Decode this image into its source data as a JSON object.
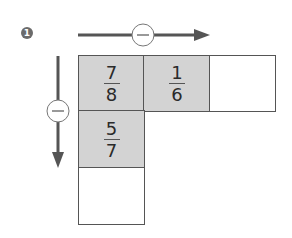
{
  "problem": {
    "number": "1",
    "operation_symbol": "−",
    "horizontal_operator": "−",
    "vertical_operator": "−",
    "colors": {
      "shaded": "#d3d3d3",
      "border": "#555555",
      "arrow": "#555555",
      "badge": "#6b6b6b"
    },
    "grid": {
      "row1": [
        {
          "numerator": "7",
          "denominator": "8",
          "shaded": true
        },
        {
          "numerator": "1",
          "denominator": "6",
          "shaded": true
        },
        {
          "numerator": "",
          "denominator": "",
          "shaded": false
        }
      ],
      "row2": [
        {
          "numerator": "5",
          "denominator": "7",
          "shaded": true
        }
      ],
      "row3": [
        {
          "numerator": "",
          "denominator": "",
          "shaded": false
        }
      ]
    }
  }
}
